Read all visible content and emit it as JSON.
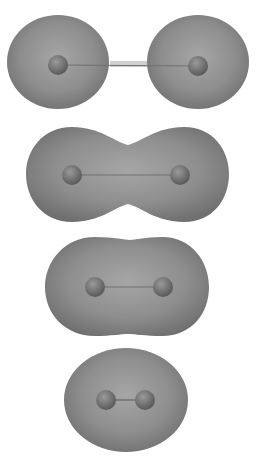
{
  "figure": {
    "colors": {
      "background": "#ffffff",
      "surface": "#8a8a8a",
      "atom": "#6e6e6e",
      "bond": "#707070"
    },
    "panels": [
      {
        "id": "panel-1",
        "state": "separated atoms",
        "atoms": [
          [
            58,
            65
          ],
          [
            198,
            66
          ]
        ]
      },
      {
        "id": "panel-2",
        "state": "overlapping",
        "atoms": [
          [
            72,
            175
          ],
          [
            180,
            175
          ]
        ]
      },
      {
        "id": "panel-3",
        "state": "merged",
        "atoms": [
          [
            95,
            287
          ],
          [
            163,
            287
          ]
        ]
      },
      {
        "id": "panel-4",
        "state": "bonded molecule",
        "atoms": [
          [
            106,
            400
          ],
          [
            145,
            400
          ]
        ]
      }
    ]
  }
}
